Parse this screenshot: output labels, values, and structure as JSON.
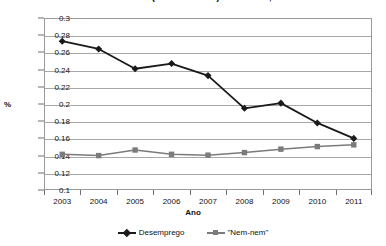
{
  "chart_data": {
    "type": "line",
    "title": "ENTRE OS PAIS (14 A 22 ANOS) — BRASIL, 2003-11",
    "title_clipped": true,
    "xlabel": "Ano",
    "ylabel": "%",
    "categories": [
      "2003",
      "2004",
      "2005",
      "2006",
      "2007",
      "2008",
      "2009",
      "2010",
      "2011"
    ],
    "x": [
      2003,
      2004,
      2005,
      2006,
      2007,
      2008,
      2009,
      2010,
      2011
    ],
    "ylim": [
      0.1,
      0.3
    ],
    "ytick_step": 0.02,
    "yticks": [
      "0.3",
      "0.28",
      "0.26",
      "0.24",
      "0.22",
      "0.2",
      "0.18",
      "0.16",
      "0.14",
      "0.12",
      "0.1"
    ],
    "ytick_values": [
      0.3,
      0.28,
      0.26,
      0.24,
      0.22,
      0.2,
      0.18,
      0.16,
      0.14,
      0.12,
      0.1
    ],
    "grid": true,
    "legend_position": "bottom",
    "series": [
      {
        "name": "Desemprego",
        "marker": "diamond",
        "color": "#1a1a1a",
        "values": [
          0.273,
          0.264,
          0.241,
          0.247,
          0.233,
          0.195,
          0.201,
          0.178,
          0.16
        ]
      },
      {
        "name": "\"Nem-nem\"",
        "marker": "square",
        "color": "#7b7b7b",
        "values": [
          0.1415,
          0.14,
          0.1465,
          0.1415,
          0.1405,
          0.1435,
          0.1475,
          0.1505,
          0.1525
        ]
      }
    ]
  },
  "legend": {
    "items": [
      {
        "label": "Desemprego"
      },
      {
        "label": "\"Nem-nem\""
      }
    ]
  },
  "colors": {
    "series_desemprego": "#1a1a1a",
    "series_nemnem": "#7b7b7b",
    "gridline": "#a8a8a8",
    "frame": "#9a9a9a",
    "background": "#ffffff"
  }
}
